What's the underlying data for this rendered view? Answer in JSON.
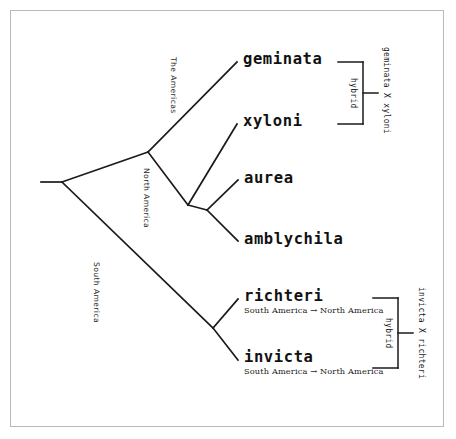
{
  "diagram": {
    "type": "phylogenetic-tree",
    "background_color": "#ffffff",
    "line_color": "#1a1a1a",
    "border_color": "#b9b9b9"
  },
  "taxa": [
    {
      "id": "geminata",
      "name": "geminata",
      "subtitle": ""
    },
    {
      "id": "xyloni",
      "name": "xyloni",
      "subtitle": ""
    },
    {
      "id": "aurea",
      "name": "aurea",
      "subtitle": ""
    },
    {
      "id": "amblychila",
      "name": "amblychila",
      "subtitle": ""
    },
    {
      "id": "richteri",
      "name": "richteri",
      "subtitle": "South America → North America"
    },
    {
      "id": "invicta",
      "name": "invicta",
      "subtitle": "South America → North America"
    }
  ],
  "branch_labels": [
    {
      "id": "the-americas",
      "text": "The Americas"
    },
    {
      "id": "north-america",
      "text": "North America"
    },
    {
      "id": "south-america",
      "text": "South America"
    }
  ],
  "hybrid_groups": [
    {
      "id": "geminata-xyloni",
      "bracket_label": "hybrid",
      "cross_label": "geminata X xyloni"
    },
    {
      "id": "invicta-richteri",
      "bracket_label": "hybrid",
      "cross_label": "invicta X richteri"
    }
  ]
}
